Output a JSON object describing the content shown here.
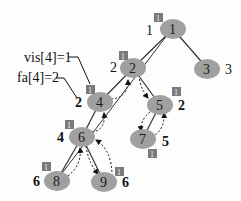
{
  "annotations": {
    "vis": "vis[4]=1",
    "fa": "fa[4]=2"
  },
  "nodes": [
    {
      "id": "1",
      "label": "1",
      "depth_label": "1",
      "vis": "1"
    },
    {
      "id": "2",
      "label": "2",
      "depth_label": "2",
      "vis": "1"
    },
    {
      "id": "3",
      "label": "3",
      "depth_label": "3"
    },
    {
      "id": "4",
      "label": "4",
      "depth_label": "2",
      "vis": "1"
    },
    {
      "id": "5",
      "label": "5",
      "depth_label": "2",
      "vis": "1"
    },
    {
      "id": "6",
      "label": "6",
      "depth_label": "4",
      "vis": "1"
    },
    {
      "id": "7",
      "label": "7",
      "depth_label": "5",
      "vis": "1"
    },
    {
      "id": "8",
      "label": "8",
      "depth_label": "6",
      "vis": "1"
    },
    {
      "id": "9",
      "label": "9",
      "depth_label": "6",
      "vis": "1"
    }
  ],
  "edges": [
    [
      "1",
      "2"
    ],
    [
      "1",
      "3"
    ],
    [
      "2",
      "4"
    ],
    [
      "2",
      "5"
    ],
    [
      "4",
      "6"
    ],
    [
      "5",
      "7"
    ],
    [
      "6",
      "8"
    ],
    [
      "6",
      "9"
    ]
  ],
  "colors": {
    "node_fill": "#a0a0a0",
    "box_fill": "#7a7a7a",
    "edge": "#333333"
  }
}
